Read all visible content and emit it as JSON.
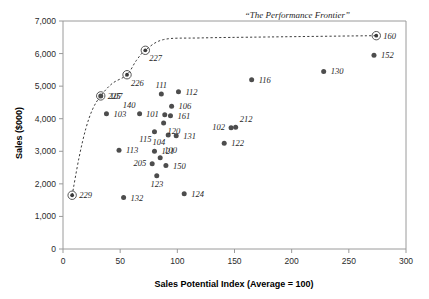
{
  "chart_data": {
    "type": "scatter",
    "title": "",
    "xlabel": "Sales Potential Index (Average = 100)",
    "ylabel": "Sales ($000)",
    "xlim": [
      0,
      300
    ],
    "ylim": [
      0,
      7000
    ],
    "xticks": [
      0,
      50,
      100,
      150,
      200,
      250,
      300
    ],
    "xtick_labels": [
      "0",
      "50",
      "100",
      "150",
      "200",
      "250",
      "300"
    ],
    "yticks": [
      0,
      1000,
      2000,
      3000,
      4000,
      5000,
      6000,
      7000
    ],
    "ytick_labels": [
      "0",
      "1,000",
      "2,000",
      "3,000",
      "4,000",
      "5,000",
      "6,000",
      "7,000"
    ],
    "grid": false,
    "legend": "none",
    "annotations": [
      {
        "text": "“The Performance Frontier”",
        "x": 205,
        "y": 7000
      }
    ],
    "series": [
      {
        "name": "Frontier territories",
        "marker": "circled-dot",
        "points": [
          {
            "label": "229",
            "x": 8,
            "y": 1650,
            "label_pos": "right"
          },
          {
            "label": "225",
            "x": 33,
            "y": 4700,
            "label_pos": "right"
          },
          {
            "label": "226",
            "x": 56,
            "y": 5350,
            "label_pos": "below-right"
          },
          {
            "label": "227",
            "x": 72,
            "y": 6100,
            "label_pos": "below-right"
          },
          {
            "label": "160",
            "x": 274,
            "y": 6550,
            "label_pos": "right"
          }
        ]
      },
      {
        "name": "Territories",
        "marker": "dot",
        "points": [
          {
            "label": "107",
            "x": 33,
            "y": 4700,
            "label_pos": "right-offset"
          },
          {
            "label": "103",
            "x": 38,
            "y": 4150,
            "label_pos": "right"
          },
          {
            "label": "140",
            "x": 67,
            "y": 4150,
            "label_pos": "above-left"
          },
          {
            "label": "111",
            "x": 86,
            "y": 4760,
            "label_pos": "above"
          },
          {
            "label": "112",
            "x": 101,
            "y": 4830,
            "label_pos": "right"
          },
          {
            "label": "106",
            "x": 95,
            "y": 4380,
            "label_pos": "right"
          },
          {
            "label": "101",
            "x": 89,
            "y": 4120,
            "label_pos": "left"
          },
          {
            "label": "161",
            "x": 94,
            "y": 4090,
            "label_pos": "right"
          },
          {
            "label": "120",
            "x": 88,
            "y": 3870,
            "label_pos": "below-right"
          },
          {
            "label": "104",
            "x": 92,
            "y": 3500,
            "label_pos": "below-left"
          },
          {
            "label": "131",
            "x": 99,
            "y": 3480,
            "label_pos": "right"
          },
          {
            "label": "115",
            "x": 80,
            "y": 3600,
            "label_pos": "below-left"
          },
          {
            "label": "113",
            "x": 49,
            "y": 3030,
            "label_pos": "right"
          },
          {
            "label": "121",
            "x": 80,
            "y": 3000,
            "label_pos": "right"
          },
          {
            "label": "100",
            "x": 85,
            "y": 2800,
            "label_pos": "above-right"
          },
          {
            "label": "205",
            "x": 78,
            "y": 2620,
            "label_pos": "left"
          },
          {
            "label": "150",
            "x": 90,
            "y": 2560,
            "label_pos": "right"
          },
          {
            "label": "123",
            "x": 82,
            "y": 2250,
            "label_pos": "below"
          },
          {
            "label": "132",
            "x": 53,
            "y": 1580,
            "label_pos": "right"
          },
          {
            "label": "124",
            "x": 106,
            "y": 1700,
            "label_pos": "right"
          },
          {
            "label": "122",
            "x": 141,
            "y": 3250,
            "label_pos": "right"
          },
          {
            "label": "102",
            "x": 147,
            "y": 3720,
            "label_pos": "left"
          },
          {
            "label": "212",
            "x": 151,
            "y": 3740,
            "label_pos": "above-right"
          },
          {
            "label": "116",
            "x": 165,
            "y": 5200,
            "label_pos": "right"
          },
          {
            "label": "130",
            "x": 228,
            "y": 5450,
            "label_pos": "right"
          },
          {
            "label": "152",
            "x": 272,
            "y": 5950,
            "label_pos": "right"
          }
        ]
      }
    ],
    "frontier_curve": {
      "label": "“The Performance Frontier”",
      "style": "dashed",
      "points": [
        {
          "x": 8,
          "y": 1650
        },
        {
          "x": 14,
          "y": 2800
        },
        {
          "x": 20,
          "y": 3700
        },
        {
          "x": 26,
          "y": 4300
        },
        {
          "x": 33,
          "y": 4700
        },
        {
          "x": 43,
          "y": 5080
        },
        {
          "x": 56,
          "y": 5350
        },
        {
          "x": 64,
          "y": 5780
        },
        {
          "x": 72,
          "y": 6100
        },
        {
          "x": 88,
          "y": 6430
        },
        {
          "x": 120,
          "y": 6480
        },
        {
          "x": 180,
          "y": 6510
        },
        {
          "x": 274,
          "y": 6550
        }
      ]
    },
    "colors": {
      "point": "#4d4d4d",
      "axis": "#9a9a9a",
      "frontier": "#3c3c3c",
      "text": "#1a1a1a"
    }
  }
}
